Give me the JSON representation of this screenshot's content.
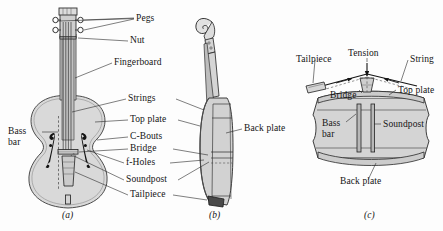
{
  "figure": {
    "background_color": "#fdfdfd",
    "ink_color": "#141414",
    "body_fill": "#d9d9d9",
    "panel_fill": "#d2d2d2",
    "dark_fill": "#5d5d5d"
  },
  "panel_a": {
    "caption": "(a)",
    "labels": {
      "pegs": "Pegs",
      "nut": "Nut",
      "fingerboard": "Fingerboard",
      "strings": "Strings",
      "top_plate": "Top plate",
      "c_bouts": "C-Bouts",
      "bridge": "Bridge",
      "f_holes": "f-Holes",
      "soundpost": "Soundpost",
      "tailpiece": "Tailpiece",
      "bass_bar": "Bass bar"
    }
  },
  "panel_b": {
    "caption": "(b)",
    "labels": {
      "back_plate": "Back plate"
    }
  },
  "panel_c": {
    "caption": "(c)",
    "labels": {
      "tailpiece": "Tailpiece",
      "tension": "Tension",
      "string": "String",
      "bridge": "Bridge",
      "top_plate": "Top plate",
      "bass_bar": "Bass bar",
      "soundpost": "Soundpost",
      "back_plate": "Back plate"
    }
  }
}
